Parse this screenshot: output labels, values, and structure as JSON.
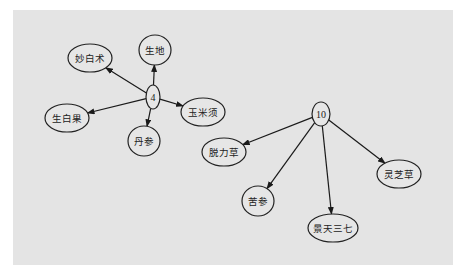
{
  "diagram": {
    "type": "directed-graph",
    "background": "#e4e4e4",
    "panel": {
      "x": 13,
      "y": 10,
      "width": 440,
      "height": 255
    },
    "nodes": [
      {
        "id": "n4",
        "label": "4",
        "cx": 153,
        "cy": 97,
        "rx": 7,
        "ry": 12
      },
      {
        "id": "chao-bai-zhu",
        "label": "妙白术",
        "cx": 90,
        "cy": 58,
        "rx": 22,
        "ry": 14
      },
      {
        "id": "sheng-di",
        "label": "生地",
        "cx": 155,
        "cy": 50,
        "rx": 16,
        "ry": 15
      },
      {
        "id": "yu-mi-xu",
        "label": "玉米须",
        "cx": 203,
        "cy": 112,
        "rx": 22,
        "ry": 14
      },
      {
        "id": "sheng-bai-guo",
        "label": "生白果",
        "cx": 67,
        "cy": 118,
        "rx": 22,
        "ry": 14
      },
      {
        "id": "dan-shen",
        "label": "丹参",
        "cx": 144,
        "cy": 141,
        "rx": 16,
        "ry": 15
      },
      {
        "id": "n10",
        "label": "10",
        "cx": 321,
        "cy": 114,
        "rx": 9,
        "ry": 12
      },
      {
        "id": "tuo-li-cao",
        "label": "脱力草",
        "cx": 224,
        "cy": 152,
        "rx": 22,
        "ry": 14
      },
      {
        "id": "ku-shen",
        "label": "苦参",
        "cx": 258,
        "cy": 201,
        "rx": 16,
        "ry": 15
      },
      {
        "id": "jing-tian-san-qi",
        "label": "景天三七",
        "cx": 333,
        "cy": 228,
        "rx": 25,
        "ry": 14
      },
      {
        "id": "ling-zhi-cao",
        "label": "灵芝草",
        "cx": 399,
        "cy": 174,
        "rx": 22,
        "ry": 14
      }
    ],
    "edges": [
      {
        "from": "n4",
        "to": "chao-bai-zhu"
      },
      {
        "from": "n4",
        "to": "sheng-di"
      },
      {
        "from": "n4",
        "to": "yu-mi-xu"
      },
      {
        "from": "n4",
        "to": "sheng-bai-guo"
      },
      {
        "from": "n4",
        "to": "dan-shen"
      },
      {
        "from": "n10",
        "to": "tuo-li-cao"
      },
      {
        "from": "n10",
        "to": "ku-shen"
      },
      {
        "from": "n10",
        "to": "jing-tian-san-qi"
      },
      {
        "from": "n10",
        "to": "ling-zhi-cao"
      }
    ]
  }
}
